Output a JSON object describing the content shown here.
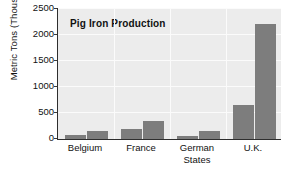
{
  "chart": {
    "title": "Pig Iron Production",
    "ylabel": "Metric Tons (Thousands)",
    "xlabel": ""
  },
  "chart_data": {
    "type": "bar",
    "title": "Pig Iron Production",
    "xlabel": "",
    "ylabel": "Metric Tons (Thousands)",
    "ylim": [
      0,
      2500
    ],
    "yticks": [
      0,
      500,
      1000,
      1500,
      2000,
      2500
    ],
    "ytick_labels": [
      "0",
      "500",
      "1000",
      "1500",
      "2000",
      "2500"
    ],
    "grid": true,
    "legend": null,
    "categories": [
      "Belgium",
      "France",
      "German States",
      "U.K."
    ],
    "category_labels": [
      [
        "Belgium"
      ],
      [
        "France"
      ],
      [
        "German",
        "States"
      ],
      [
        "U.K."
      ]
    ],
    "series": [
      {
        "name": "series-1",
        "values": [
          80,
          200,
          50,
          650
        ]
      },
      {
        "name": "series-2",
        "values": [
          150,
          350,
          160,
          2200
        ]
      }
    ],
    "bar_color": "#7d7d7d",
    "plot_background": "#ececec",
    "gridline_color": "#fbfbfb",
    "axis_color": "#2e2e2e"
  }
}
